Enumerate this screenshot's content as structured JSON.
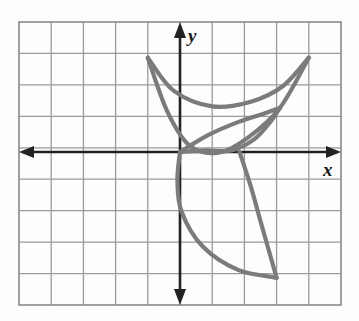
{
  "figure": {
    "type": "coordinate-grid-graph",
    "title": "",
    "axis_labels": {
      "x": "x",
      "y": "y"
    },
    "background": "#fdfdfd",
    "grid": {
      "visible": true,
      "color": "#9a9a9a",
      "border_color": "#8a8a8a",
      "columns": 10,
      "rows": 9,
      "cell_px": 32.2,
      "left_px": 19,
      "top_px": 22,
      "right_px": 341,
      "bottom_px": 305,
      "origin_px": {
        "x": 180,
        "y": 152
      },
      "x_range": [
        -5,
        5
      ],
      "y_range": [
        -5,
        4
      ]
    },
    "axes": {
      "color": "#222222",
      "stroke_px": 2.6,
      "arrowheads": [
        "left",
        "right",
        "up",
        "down"
      ],
      "x_axis_y": 152,
      "y_axis_x": 180
    },
    "curves": {
      "color": "#7b7b7b",
      "stroke_px": 4.2,
      "items": [
        {
          "name": "upper-crescent-outer",
          "description": "outer arc of top crescent, from (-1,3) sweeping down through (0.6,0.3) to (4,3)",
          "points": [
            [
              -1,
              3
            ],
            [
              -0.4,
              1.3
            ],
            [
              0.3,
              0.2
            ],
            [
              1.2,
              -0.02
            ],
            [
              2.1,
              0.45
            ],
            [
              3.1,
              1.4
            ],
            [
              4,
              3
            ]
          ]
        },
        {
          "name": "upper-crescent-inner",
          "description": "inner arc of top crescent, from (-1,3) through (1.5,1.0) to (4,3)",
          "points": [
            [
              -1,
              3
            ],
            [
              -0.2,
              1.95
            ],
            [
              1.0,
              1.45
            ],
            [
              2.2,
              1.6
            ],
            [
              3.2,
              2.1
            ],
            [
              4,
              3
            ]
          ]
        },
        {
          "name": "middle-leaf-upper",
          "description": "upper edge of slim leaf, from (0,0) rising to (3.1,1.4)",
          "points": [
            [
              0,
              0
            ],
            [
              0.9,
              0.55
            ],
            [
              1.8,
              0.95
            ],
            [
              2.6,
              1.22
            ],
            [
              3.1,
              1.4
            ]
          ]
        },
        {
          "name": "middle-leaf-lower",
          "description": "lower edge of slim leaf, from (0,0) through (1.8,0.02) to (3.1,1.4)",
          "points": [
            [
              0,
              0
            ],
            [
              0.8,
              0.05
            ],
            [
              1.6,
              0.05
            ],
            [
              2.3,
              0.4
            ],
            [
              2.8,
              0.95
            ],
            [
              3.1,
              1.4
            ]
          ]
        },
        {
          "name": "lower-crescent-left",
          "description": "left arc of bottom crescent, from (0,0) down through (0,-2) to (3,-4)",
          "points": [
            [
              0,
              0
            ],
            [
              -0.08,
              -0.9
            ],
            [
              0.05,
              -1.9
            ],
            [
              0.7,
              -3.0
            ],
            [
              1.8,
              -3.75
            ],
            [
              3,
              -4
            ]
          ]
        },
        {
          "name": "lower-crescent-right",
          "description": "right arc of bottom crescent, from (1.85,0) bulging right to (3,-4)",
          "points": [
            [
              1.85,
              0
            ],
            [
              2.2,
              -1.1
            ],
            [
              2.5,
              -2.2
            ],
            [
              2.75,
              -3.1
            ],
            [
              3,
              -4
            ]
          ]
        }
      ]
    },
    "key_points": [
      {
        "label": "origin",
        "x": 0,
        "y": 0
      },
      {
        "label": "right-x-intercept",
        "x": 1.85,
        "y": 0
      },
      {
        "label": "upper-left-cusp",
        "x": -1,
        "y": 3
      },
      {
        "label": "upper-right-cusp",
        "x": 4,
        "y": 3
      },
      {
        "label": "leaf-tip",
        "x": 3.1,
        "y": 1.4
      },
      {
        "label": "lower-cusp",
        "x": 3,
        "y": -4
      }
    ]
  }
}
